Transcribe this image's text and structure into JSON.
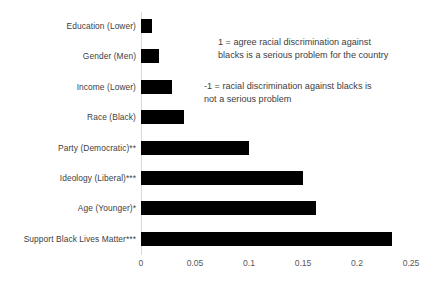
{
  "chart_data": {
    "type": "bar",
    "orientation": "horizontal",
    "title": "",
    "xlabel": "",
    "ylabel": "",
    "xlim": [
      0,
      0.25
    ],
    "grid": false,
    "legend": null,
    "bar_color": "#000000",
    "axis_color": "#d9d9d9",
    "categories": [
      "Education (Lower)",
      "Gender (Men)",
      "Income (Lower)",
      "Race (Black)",
      "Party (Democratic)**",
      "Ideology (Liberal)***",
      "Age (Younger)*",
      "Support Black Lives Matter***"
    ],
    "values": [
      0.01,
      0.017,
      0.029,
      0.04,
      0.1,
      0.15,
      0.162,
      0.232
    ],
    "xticks": [
      0,
      0.05,
      0.1,
      0.15,
      0.2,
      0.25
    ],
    "xticklabels": [
      "0",
      "0.05",
      "0.1",
      "0.15",
      "0.2",
      "0.25"
    ],
    "annotations": [
      "1 = agree racial discrimination against\nblacks is a serious problem for the country",
      "-1 = racial discrimination against blacks is\nnot a serious problem"
    ]
  }
}
